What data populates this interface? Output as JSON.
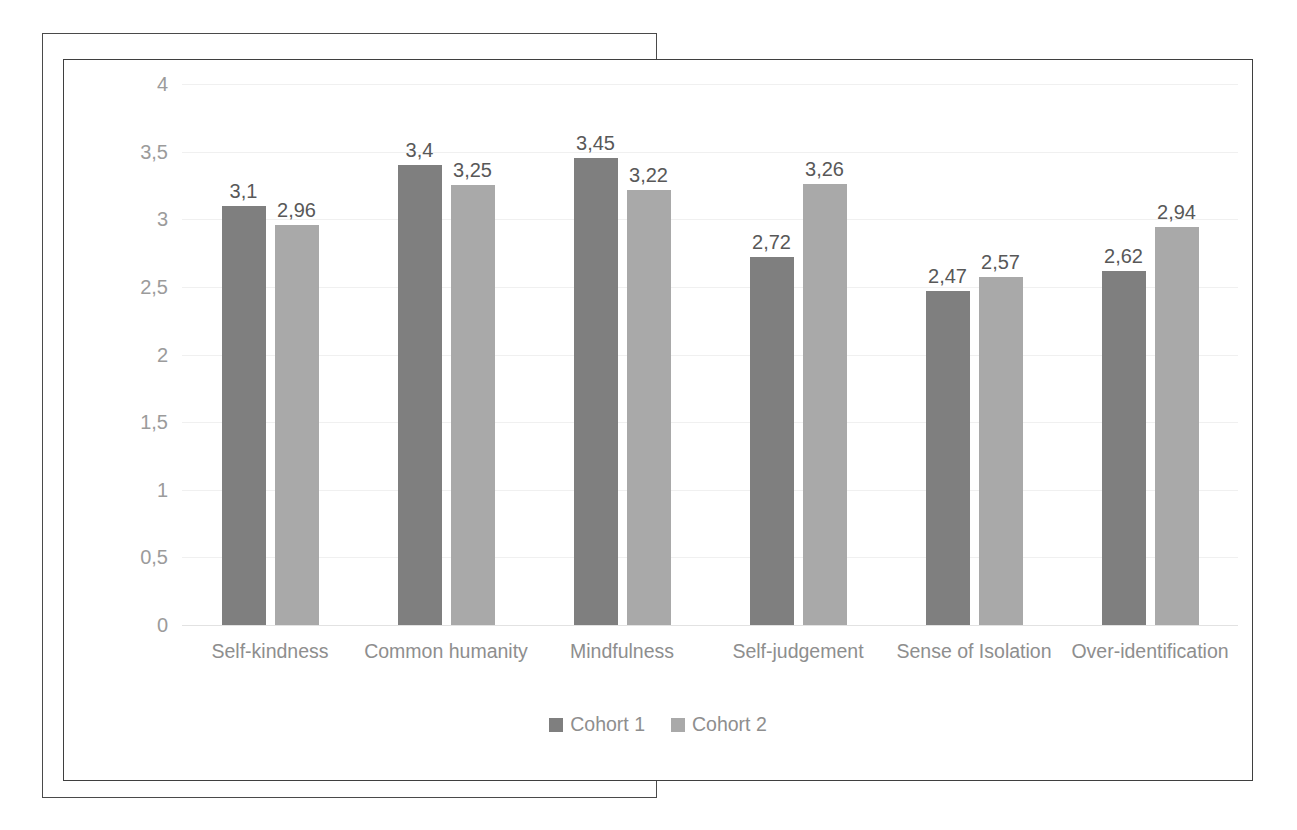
{
  "chart_data": {
    "type": "bar",
    "title": "",
    "subtitle": "",
    "xlabel": "",
    "ylabel": "",
    "ylim": [
      0,
      4
    ],
    "yticks": [
      "0",
      "0,5",
      "1",
      "1,5",
      "2",
      "2,5",
      "3",
      "3,5",
      "4"
    ],
    "ytick_values": [
      0,
      0.5,
      1,
      1.5,
      2,
      2.5,
      3,
      3.5,
      4
    ],
    "grid": true,
    "legend_position": "bottom",
    "decimal_separator": ",",
    "categories": [
      "Self-kindness",
      "Common humanity",
      "Mindfulness",
      "Self-judgement",
      "Sense of Isolation",
      "Over-identification"
    ],
    "series": [
      {
        "name": "Cohort 1",
        "color": "#7f7f7f",
        "values": [
          3.1,
          3.4,
          3.45,
          2.72,
          2.47,
          2.62
        ],
        "labels": [
          "3,1",
          "3,4",
          "3,45",
          "2,72",
          "2,47",
          "2,62"
        ]
      },
      {
        "name": "Cohort 2",
        "color": "#a9a9a9",
        "values": [
          2.96,
          3.25,
          3.22,
          3.26,
          2.57,
          2.94
        ],
        "labels": [
          "2,96",
          "3,25",
          "3,22",
          "3,26",
          "2,57",
          "2,94"
        ]
      }
    ]
  },
  "legend": {
    "items": [
      {
        "label": "Cohort 1",
        "swatch": "s0"
      },
      {
        "label": "Cohort 2",
        "swatch": "s1"
      }
    ]
  },
  "colors": {
    "series_1": "#7f7f7f",
    "series_2": "#a9a9a9",
    "gridline": "#f0f0f0",
    "tick_text": "#9b9b9b",
    "label_text": "#585858",
    "category_text": "#8e8e8e",
    "frame_border": "#3f3f3f"
  }
}
